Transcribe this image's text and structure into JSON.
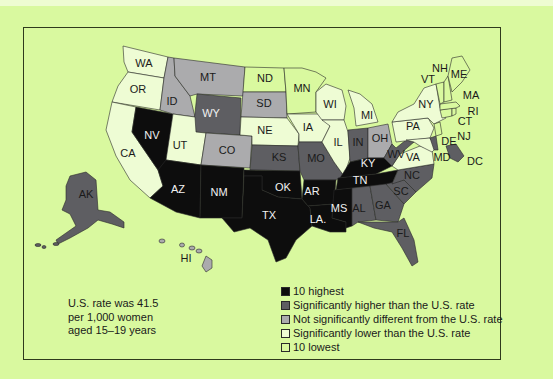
{
  "colors": {
    "background": "#d9f99f",
    "highest": "#0d0d0d",
    "higher": "#5e5e62",
    "not_significant": "#ababad",
    "lower": "#eefcd4",
    "lowest": "#d9f99f"
  },
  "note": {
    "line1": "U.S. rate was 41.5",
    "line2": "per 1,000 women",
    "line3": "aged 15–19 years"
  },
  "legend": [
    {
      "key": "highest",
      "label": "10 highest"
    },
    {
      "key": "higher",
      "label": "Significantly higher than the U.S. rate"
    },
    {
      "key": "not_significant",
      "label": "Not significantly different from the U.S. rate"
    },
    {
      "key": "lower",
      "label": "Significantly lower than the U.S. rate"
    },
    {
      "key": "lowest",
      "label": "10 lowest"
    }
  ],
  "chart_data": {
    "type": "choropleth",
    "title": "",
    "note": "U.S. rate was 41.5 per 1,000 women aged 15–19 years",
    "categories": [
      "10 highest",
      "Significantly higher than the U.S. rate",
      "Not significantly different from the U.S. rate",
      "Significantly lower than the U.S. rate",
      "10 lowest"
    ],
    "states": {
      "highest": [
        "NV",
        "AZ",
        "NM",
        "TX",
        "OK",
        "AR",
        "LA",
        "MS",
        "TN",
        "KY"
      ],
      "higher": [
        "WY",
        "KS",
        "MO",
        "IN",
        "WV",
        "AL",
        "GA",
        "SC",
        "NC",
        "FL",
        "AK",
        "DE",
        "DC"
      ],
      "not_significant": [
        "MT",
        "ID",
        "SD",
        "CO",
        "OH",
        "HI"
      ],
      "lower": [
        "WA",
        "OR",
        "CA",
        "UT",
        "NE",
        "IA",
        "WI",
        "MI",
        "IL",
        "PA",
        "VA",
        "MD",
        "NY"
      ],
      "lowest": [
        "ND",
        "MN",
        "VT",
        "NH",
        "ME",
        "MA",
        "RI",
        "CT",
        "NJ"
      ]
    },
    "legend_position": "bottom-right"
  },
  "labels": {
    "WA": {
      "text": "WA",
      "x": 144,
      "y": 64,
      "dark": true
    },
    "OR": {
      "text": "OR",
      "x": 138,
      "y": 90,
      "dark": true
    },
    "CA": {
      "text": "CA",
      "x": 128,
      "y": 154,
      "dark": true
    },
    "NV": {
      "text": "NV",
      "x": 152,
      "y": 136,
      "dark": false
    },
    "ID": {
      "text": "ID",
      "x": 172,
      "y": 102,
      "dark": true
    },
    "MT": {
      "text": "MT",
      "x": 208,
      "y": 78,
      "dark": true
    },
    "WY": {
      "text": "WY",
      "x": 211,
      "y": 114,
      "dark": false
    },
    "UT": {
      "text": "UT",
      "x": 180,
      "y": 146,
      "dark": true
    },
    "CO": {
      "text": "CO",
      "x": 227,
      "y": 151,
      "dark": true
    },
    "AZ": {
      "text": "AZ",
      "x": 178,
      "y": 190,
      "dark": false
    },
    "NM": {
      "text": "NM",
      "x": 219,
      "y": 193,
      "dark": false
    },
    "ND": {
      "text": "ND",
      "x": 265,
      "y": 79,
      "dark": true
    },
    "SD": {
      "text": "SD",
      "x": 264,
      "y": 104,
      "dark": true
    },
    "NE": {
      "text": "NE",
      "x": 265,
      "y": 131,
      "dark": true
    },
    "KS": {
      "text": "KS",
      "x": 279,
      "y": 158,
      "dark": true
    },
    "OK": {
      "text": "OK",
      "x": 283,
      "y": 188,
      "dark": false
    },
    "TX": {
      "text": "TX",
      "x": 269,
      "y": 216,
      "dark": false
    },
    "MN": {
      "text": "MN",
      "x": 302,
      "y": 89,
      "dark": true
    },
    "IA": {
      "text": "IA",
      "x": 308,
      "y": 128,
      "dark": true
    },
    "MO": {
      "text": "MO",
      "x": 316,
      "y": 159,
      "dark": true
    },
    "AR": {
      "text": "AR",
      "x": 312,
      "y": 192,
      "dark": false
    },
    "LA": {
      "text": "LA.",
      "x": 318,
      "y": 220,
      "dark": false
    },
    "WI": {
      "text": "WI",
      "x": 330,
      "y": 105,
      "dark": true
    },
    "IL": {
      "text": "IL",
      "x": 338,
      "y": 143,
      "dark": true
    },
    "MS": {
      "text": "MS",
      "x": 339,
      "y": 209,
      "dark": false
    },
    "MI": {
      "text": "MI",
      "x": 367,
      "y": 116,
      "dark": true
    },
    "IN": {
      "text": "IN",
      "x": 358,
      "y": 143,
      "dark": true
    },
    "OH": {
      "text": "OH",
      "x": 380,
      "y": 139,
      "dark": true
    },
    "KY": {
      "text": "KY",
      "x": 368,
      "y": 164,
      "dark": false
    },
    "TN": {
      "text": "TN",
      "x": 360,
      "y": 181,
      "dark": false
    },
    "AL": {
      "text": "AL",
      "x": 359,
      "y": 209,
      "dark": true
    },
    "GA": {
      "text": "GA",
      "x": 383,
      "y": 206,
      "dark": true
    },
    "FL": {
      "text": "FL",
      "x": 403,
      "y": 234,
      "dark": true
    },
    "SC": {
      "text": "SC",
      "x": 401,
      "y": 192,
      "dark": true
    },
    "NC": {
      "text": "NC",
      "x": 412,
      "y": 176,
      "dark": true
    },
    "WV": {
      "text": "WV",
      "x": 396,
      "y": 155,
      "dark": true
    },
    "VA": {
      "text": "VA",
      "x": 413,
      "y": 158,
      "dark": true
    },
    "PA": {
      "text": "PA",
      "x": 413,
      "y": 127,
      "dark": true
    },
    "NY": {
      "text": "NY",
      "x": 426,
      "y": 105,
      "dark": true
    },
    "MD": {
      "text": "MD",
      "x": 442,
      "y": 158,
      "dark": true
    },
    "DE": {
      "text": "DE",
      "x": 449,
      "y": 142,
      "dark": true
    },
    "NJ": {
      "text": "NJ",
      "x": 464,
      "y": 137,
      "dark": true
    },
    "DC": {
      "text": "DC",
      "x": 475,
      "y": 162,
      "dark": true
    },
    "CT": {
      "text": "CT",
      "x": 465,
      "y": 122,
      "dark": true
    },
    "RI": {
      "text": "RI",
      "x": 473,
      "y": 112,
      "dark": true
    },
    "MA": {
      "text": "MA",
      "x": 471,
      "y": 96,
      "dark": true
    },
    "ME": {
      "text": "ME",
      "x": 459,
      "y": 75,
      "dark": true
    },
    "NH": {
      "text": "NH",
      "x": 440,
      "y": 69,
      "dark": true
    },
    "VT": {
      "text": "VT",
      "x": 428,
      "y": 80,
      "dark": true
    },
    "AK": {
      "text": "AK",
      "x": 86,
      "y": 195,
      "dark": true
    },
    "HI": {
      "text": "HI",
      "x": 186,
      "y": 259,
      "dark": true
    }
  }
}
